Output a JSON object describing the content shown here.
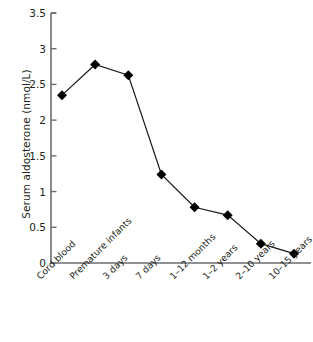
{
  "chart_data": {
    "type": "line",
    "title": "",
    "xlabel": "",
    "ylabel": "Serum aldosterone (nmol/L)",
    "categories": [
      "Cord blood",
      "Premature infants",
      "3 days",
      "7 days",
      "1–12 months",
      "1–2 years",
      "2–10 years",
      "10–15 years"
    ],
    "values": [
      2.35,
      2.78,
      2.63,
      1.24,
      0.78,
      0.67,
      0.27,
      0.13
    ],
    "series": [
      {
        "name": "Serum aldosterone",
        "values": [
          2.35,
          2.78,
          2.63,
          1.24,
          0.78,
          0.67,
          0.27,
          0.13
        ]
      }
    ],
    "ylim": [
      0,
      3.5
    ],
    "ytick_labels": [
      "0",
      "0.5",
      "1",
      "1.5",
      "2",
      "2.5",
      "3",
      "3.5"
    ],
    "ytick_values": [
      0,
      0.5,
      1,
      1.5,
      2,
      2.5,
      3,
      3.5
    ],
    "grid": false,
    "legend": false,
    "legend_position": "none",
    "marker": "diamond",
    "line_color": "#1a1a1a",
    "marker_color": "#000000",
    "axis_color": "#6d6e71",
    "text_color": "#231f20",
    "background_color": "#ffffff"
  }
}
